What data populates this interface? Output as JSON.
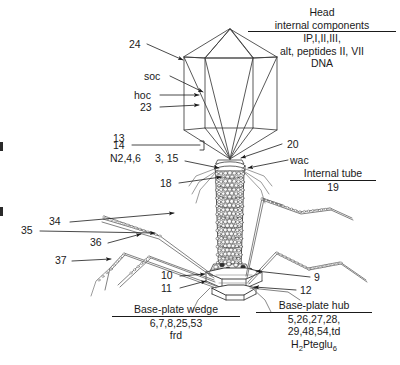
{
  "figure": {
    "title_block": {
      "line1": "Head",
      "line2_underlined": "internal components",
      "line3": "IP,I,II,III,",
      "line4": "alt, peptides II, VII",
      "line5": "DNA"
    },
    "head_labels": {
      "n24": "24",
      "soc": "soc",
      "hoc": "hoc",
      "n23": "23"
    },
    "neck_labels": {
      "n13": "13",
      "n14": "14",
      "n246": "N2,4,6",
      "n3_15": "3, 15",
      "n18": "18",
      "n20": "20",
      "wac": "wac",
      "internal_tube_underlined": "Internal tube",
      "n19": "19"
    },
    "fiber_labels": {
      "n34": "34",
      "n35": "35",
      "n36": "36",
      "n37": "37"
    },
    "baseplate_labels": {
      "n10": "10",
      "n11": "11",
      "n9": "9",
      "n12": "12"
    },
    "wedge_block": {
      "heading_underlined": "Base-plate wedge",
      "genes": "6,7,8,25,53",
      "extra": "frd"
    },
    "hub_block": {
      "heading_underlined": "Base-plate hub",
      "genes_line1": "5,26,27,28,",
      "genes_line2": "29,48,54,td",
      "cofactor_pre": "H",
      "cofactor_sub1": "2",
      "cofactor_mid": "Pteglu",
      "cofactor_sub2": "6"
    },
    "colors": {
      "ink": "#1a1a1a",
      "line": "#3b3b3b",
      "fill": "#ffffff",
      "shade": "#e9e9e9"
    }
  }
}
